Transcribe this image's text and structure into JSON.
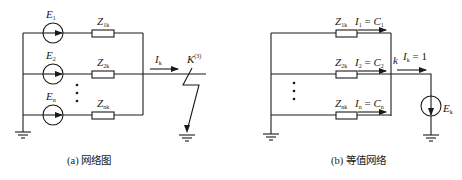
{
  "diagram_a": {
    "caption": "(a) 网络图",
    "sources": [
      {
        "main": "E",
        "sub": "1"
      },
      {
        "main": "E",
        "sub": "2"
      },
      {
        "main": "E",
        "sub": "n"
      }
    ],
    "impedances": [
      {
        "main": "Z",
        "sub": "1k"
      },
      {
        "main": "Z",
        "sub": "2k"
      },
      {
        "main": "Z",
        "sub": "nk"
      }
    ],
    "current": {
      "main": "I",
      "sub": "k"
    },
    "fault": {
      "main": "K",
      "sup": "(3)"
    },
    "ellipsis": "⋮"
  },
  "diagram_b": {
    "caption": "(b) 等值网络",
    "impedances": [
      {
        "main": "Z",
        "sub": "1k"
      },
      {
        "main": "Z",
        "sub": "2k"
      },
      {
        "main": "Z",
        "sub": "nk"
      }
    ],
    "branch_currents": [
      {
        "i": "I",
        "i_sub": "1",
        "eq": " = ",
        "c": "C",
        "c_sub": "1"
      },
      {
        "i": "I",
        "i_sub": "2",
        "eq": " = ",
        "c": "C",
        "c_sub": "2"
      },
      {
        "i": "I",
        "i_sub": "n",
        "eq": " = ",
        "c": "C",
        "c_sub": "n"
      }
    ],
    "node": "k",
    "total_current": {
      "main": "I",
      "sub": "k",
      "value": " = 1"
    },
    "source": {
      "main": "E",
      "sub": "k"
    }
  }
}
